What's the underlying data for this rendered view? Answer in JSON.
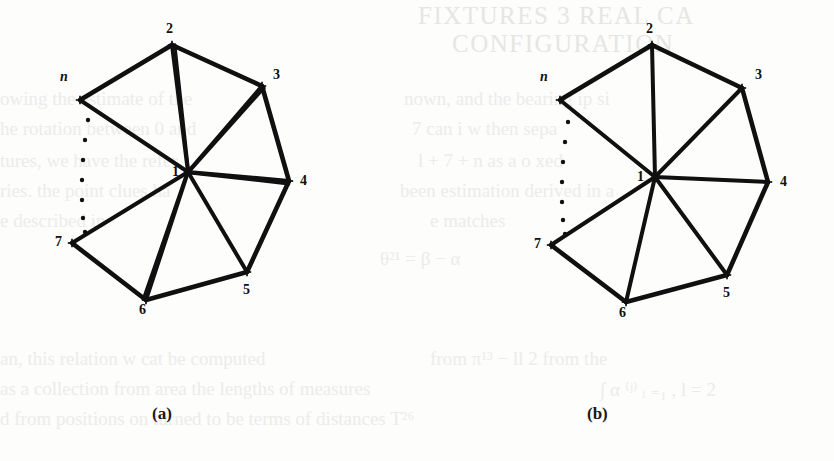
{
  "figure": {
    "caption_a": "(a)",
    "caption_b": "(b)",
    "background_color": "#fdfdfc",
    "ink_color": "#101010",
    "bleed_color": "#e9e9e6"
  },
  "chart_data": {
    "type": "diagram",
    "title": "",
    "vertex_marker": "+",
    "panels": [
      {
        "id": "a",
        "caption": "(a)",
        "caption_position": {
          "x": 163,
          "y": 415
        },
        "vertices": [
          {
            "label": "1",
            "x": 188,
            "y": 172,
            "label_x": 172,
            "label_y": 165,
            "italic": false
          },
          {
            "label": "2",
            "x": 172,
            "y": 45,
            "label_x": 166,
            "label_y": 22,
            "italic": false
          },
          {
            "label": "3",
            "x": 262,
            "y": 86,
            "label_x": 273,
            "label_y": 68,
            "italic": false
          },
          {
            "label": "4",
            "x": 289,
            "y": 181,
            "label_x": 300,
            "label_y": 174,
            "italic": false
          },
          {
            "label": "5",
            "x": 247,
            "y": 272,
            "label_x": 243,
            "label_y": 283,
            "italic": false
          },
          {
            "label": "6",
            "x": 146,
            "y": 300,
            "label_x": 139,
            "label_y": 303,
            "italic": false
          },
          {
            "label": "7",
            "x": 72,
            "y": 243,
            "label_x": 55,
            "label_y": 235,
            "italic": false
          },
          {
            "label": "n",
            "x": 80,
            "y": 100,
            "label_x": 60,
            "label_y": 70,
            "italic": true
          }
        ],
        "spokes": [
          {
            "from": "1",
            "to": "2",
            "doubled": true
          },
          {
            "from": "1",
            "to": "3",
            "doubled": true
          },
          {
            "from": "1",
            "to": "4",
            "doubled": true
          },
          {
            "from": "1",
            "to": "5",
            "doubled": false
          },
          {
            "from": "1",
            "to": "6",
            "doubled": true
          },
          {
            "from": "1",
            "to": "7",
            "doubled": false
          },
          {
            "from": "1",
            "to": "n",
            "doubled": false
          }
        ],
        "boundary": [
          {
            "from": "n",
            "to": "2"
          },
          {
            "from": "2",
            "to": "3"
          },
          {
            "from": "3",
            "to": "4"
          },
          {
            "from": "4",
            "to": "5"
          },
          {
            "from": "5",
            "to": "6"
          },
          {
            "from": "6",
            "to": "7"
          }
        ],
        "dots": [
          {
            "x": 88,
            "y": 120
          },
          {
            "x": 85,
            "y": 140
          },
          {
            "x": 83,
            "y": 160
          },
          {
            "x": 82,
            "y": 180
          },
          {
            "x": 82,
            "y": 200
          },
          {
            "x": 83,
            "y": 218
          },
          {
            "x": 85,
            "y": 232
          }
        ]
      },
      {
        "id": "b",
        "caption": "(b)",
        "caption_position": {
          "x": 598,
          "y": 415
        },
        "vertices": [
          {
            "label": "1",
            "x": 655,
            "y": 177,
            "label_x": 637,
            "label_y": 170,
            "italic": false
          },
          {
            "label": "2",
            "x": 652,
            "y": 45,
            "label_x": 646,
            "label_y": 22,
            "italic": false
          },
          {
            "label": "3",
            "x": 742,
            "y": 88,
            "label_x": 755,
            "label_y": 68,
            "italic": false
          },
          {
            "label": "4",
            "x": 768,
            "y": 182,
            "label_x": 780,
            "label_y": 175,
            "italic": false
          },
          {
            "label": "5",
            "x": 727,
            "y": 275,
            "label_x": 723,
            "label_y": 286,
            "italic": false
          },
          {
            "label": "6",
            "x": 626,
            "y": 302,
            "label_x": 619,
            "label_y": 306,
            "italic": false
          },
          {
            "label": "7",
            "x": 551,
            "y": 245,
            "label_x": 534,
            "label_y": 237,
            "italic": false
          },
          {
            "label": "n",
            "x": 560,
            "y": 100,
            "label_x": 540,
            "label_y": 70,
            "italic": true
          }
        ],
        "spokes": [
          {
            "from": "1",
            "to": "2",
            "doubled": false
          },
          {
            "from": "1",
            "to": "3",
            "doubled": false
          },
          {
            "from": "1",
            "to": "4",
            "doubled": false
          },
          {
            "from": "1",
            "to": "5",
            "doubled": false
          },
          {
            "from": "1",
            "to": "6",
            "doubled": false
          },
          {
            "from": "1",
            "to": "7",
            "doubled": false
          },
          {
            "from": "1",
            "to": "n",
            "doubled": false
          }
        ],
        "boundary": [
          {
            "from": "n",
            "to": "2"
          },
          {
            "from": "2",
            "to": "3"
          },
          {
            "from": "3",
            "to": "4"
          },
          {
            "from": "4",
            "to": "5"
          },
          {
            "from": "5",
            "to": "6"
          },
          {
            "from": "6",
            "to": "7"
          }
        ],
        "dots": [
          {
            "x": 568,
            "y": 122
          },
          {
            "x": 565,
            "y": 142
          },
          {
            "x": 563,
            "y": 162
          },
          {
            "x": 562,
            "y": 182
          },
          {
            "x": 562,
            "y": 202
          },
          {
            "x": 563,
            "y": 220
          },
          {
            "x": 565,
            "y": 234
          }
        ]
      }
    ]
  },
  "bleed_through": {
    "lines": [
      {
        "text": "FIXTURES 3 REAL CA",
        "x": 418,
        "y": 2,
        "cls": "hdr"
      },
      {
        "text": "CONFIGURATION",
        "x": 452,
        "y": 30,
        "cls": "hdr"
      },
      {
        "text": "owing the estimate of the",
        "x": 0,
        "y": 88,
        "cls": "body"
      },
      {
        "text": "nown, and the bearing  ip si",
        "x": 404,
        "y": 88,
        "cls": "body"
      },
      {
        "text": "he rotation between  0 and",
        "x": 0,
        "y": 118,
        "cls": "body"
      },
      {
        "text": "7 can  i  w  then  sepa",
        "x": 412,
        "y": 118,
        "cls": "body"
      },
      {
        "text": "tures, we have the refer",
        "x": 0,
        "y": 150,
        "cls": "body"
      },
      {
        "text": "l + 7 + n  as a o xed",
        "x": 418,
        "y": 150,
        "cls": "body"
      },
      {
        "text": "ries. the point clues ha",
        "x": 0,
        "y": 180,
        "cls": "body"
      },
      {
        "text": "been  estimation  derived in a",
        "x": 400,
        "y": 180,
        "cls": "body"
      },
      {
        "text": "e described in",
        "x": 0,
        "y": 210,
        "cls": "body"
      },
      {
        "text": "e matches",
        "x": 430,
        "y": 210,
        "cls": "body"
      },
      {
        "text": "θ²¹ = β − α",
        "x": 380,
        "y": 248,
        "cls": "body"
      },
      {
        "text": "an, this relation  w cat  be computed",
        "x": 0,
        "y": 348,
        "cls": "body"
      },
      {
        "text": "from  π¹³ − ll 2   from  the",
        "x": 430,
        "y": 348,
        "cls": "body"
      },
      {
        "text": "as a collection  from area  the lengths of measures",
        "x": 0,
        "y": 378,
        "cls": "body"
      },
      {
        "text": "∫ α ⁽ʲ⁾ ᵢ ₌₁ ,   l = 2",
        "x": 600,
        "y": 378,
        "cls": "body"
      },
      {
        "text": "d from    positions  on  turned  to  be  terms of  distances  T²⁶",
        "x": 0,
        "y": 408,
        "cls": "body"
      }
    ]
  }
}
